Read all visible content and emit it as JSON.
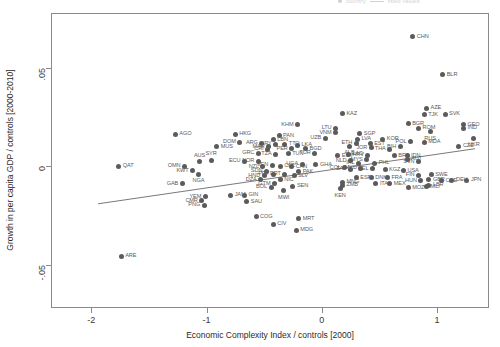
{
  "chart_data": {
    "type": "scatter",
    "title": "",
    "xlabel": "Economic Complexity Index / controls [2000]",
    "ylabel": "Growth in per capita GDP / controls [2000-2010]",
    "xlim": [
      -2.35,
      1.45
    ],
    "ylim": [
      -0.072,
      0.078
    ],
    "xticks": [
      -2,
      -1,
      0,
      1
    ],
    "xticklabels": [
      "-2",
      "-1",
      "0",
      "1"
    ],
    "yticks": [
      0.05,
      0,
      -0.05
    ],
    "yticklabels": [
      ".05",
      "0",
      "-.05"
    ],
    "grid": false,
    "legend_position": "top-right-clipped",
    "legend_entries": [
      "country",
      "fitted values"
    ],
    "point_color": "#5b5b5b",
    "line_color": "#6a6a6a",
    "fit_line": {
      "x0": -1.95,
      "y0": -0.0185,
      "x1": 1.32,
      "y1": 0.0095
    },
    "series_name": "country",
    "points": [
      {
        "code": "CHN",
        "x": 0.78,
        "y": 0.0665,
        "pos": "right"
      },
      {
        "code": "BLR",
        "x": 1.04,
        "y": 0.047,
        "pos": "right"
      },
      {
        "code": "AZE",
        "x": 0.9,
        "y": 0.03,
        "pos": "right"
      },
      {
        "code": "TJK",
        "x": 0.88,
        "y": 0.0268,
        "pos": "right"
      },
      {
        "code": "SVK",
        "x": 1.06,
        "y": 0.027,
        "pos": "right"
      },
      {
        "code": "KAZ",
        "x": 0.17,
        "y": 0.0272,
        "pos": "right"
      },
      {
        "code": "GEO",
        "x": 1.22,
        "y": 0.0218,
        "pos": "right"
      },
      {
        "code": "IND",
        "x": 1.22,
        "y": 0.0198,
        "pos": "right"
      },
      {
        "code": "BGR",
        "x": 0.74,
        "y": 0.0222,
        "pos": "right"
      },
      {
        "code": "ROM",
        "x": 0.83,
        "y": 0.02,
        "pos": "right"
      },
      {
        "code": "RUS",
        "x": 0.93,
        "y": 0.0182,
        "pos": "below"
      },
      {
        "code": "KHM",
        "x": -0.22,
        "y": 0.0218,
        "pos": "left"
      },
      {
        "code": "LTU",
        "x": 0.11,
        "y": 0.0198,
        "pos": "left"
      },
      {
        "code": "VNM",
        "x": 0.11,
        "y": 0.0176,
        "pos": "left"
      },
      {
        "code": "SGP",
        "x": 0.32,
        "y": 0.0172,
        "pos": "right"
      },
      {
        "code": "UKR",
        "x": 1.31,
        "y": 0.0148,
        "pos": "below"
      },
      {
        "code": "AGO",
        "x": -1.28,
        "y": 0.0168,
        "pos": "right"
      },
      {
        "code": "HKG",
        "x": -0.76,
        "y": 0.0168,
        "pos": "right"
      },
      {
        "code": "PAN",
        "x": -0.38,
        "y": 0.016,
        "pos": "right"
      },
      {
        "code": "UZB",
        "x": 0.02,
        "y": 0.0148,
        "pos": "left"
      },
      {
        "code": "LVA",
        "x": 0.3,
        "y": 0.0142,
        "pos": "right"
      },
      {
        "code": "KOR",
        "x": 0.52,
        "y": 0.0142,
        "pos": "right"
      },
      {
        "code": "POL",
        "x": 0.76,
        "y": 0.013,
        "pos": "left"
      },
      {
        "code": "MDA",
        "x": 0.88,
        "y": 0.0128,
        "pos": "right"
      },
      {
        "code": "CZE",
        "x": 1.18,
        "y": 0.0108,
        "pos": "right"
      },
      {
        "code": "LBN",
        "x": -0.43,
        "y": 0.014,
        "pos": "right"
      },
      {
        "code": "DOM",
        "x": -0.72,
        "y": 0.0128,
        "pos": "left"
      },
      {
        "code": "ARG",
        "x": -0.53,
        "y": 0.0124,
        "pos": "left"
      },
      {
        "code": "URY",
        "x": -0.41,
        "y": 0.0118,
        "pos": "left"
      },
      {
        "code": "TTO",
        "x": -0.33,
        "y": 0.0118,
        "pos": "right"
      },
      {
        "code": "ETH",
        "x": 0.29,
        "y": 0.0124,
        "pos": "left"
      },
      {
        "code": "EST",
        "x": 0.41,
        "y": 0.012,
        "pos": "right"
      },
      {
        "code": "ALB",
        "x": 0.23,
        "y": 0.0108,
        "pos": "below"
      },
      {
        "code": "JOR",
        "x": 0.42,
        "y": 0.01,
        "pos": "left"
      },
      {
        "code": "BIH",
        "x": 0.67,
        "y": 0.0104,
        "pos": "left"
      },
      {
        "code": "MAR",
        "x": -0.47,
        "y": 0.0104,
        "pos": "left"
      },
      {
        "code": "LKA",
        "x": -0.22,
        "y": 0.0112,
        "pos": "right"
      },
      {
        "code": "MUS",
        "x": -0.92,
        "y": 0.0104,
        "pos": "right"
      },
      {
        "code": "CRI",
        "x": -0.48,
        "y": 0.0092,
        "pos": "left"
      },
      {
        "code": "PER",
        "x": -0.27,
        "y": 0.0096,
        "pos": "left"
      },
      {
        "code": "BGD",
        "x": -0.15,
        "y": 0.0094,
        "pos": "right"
      },
      {
        "code": "THA",
        "x": 0.58,
        "y": 0.0092,
        "pos": "left"
      },
      {
        "code": "LAO",
        "x": 0.22,
        "y": 0.0068,
        "pos": "right"
      },
      {
        "code": "GRC",
        "x": -0.56,
        "y": 0.0072,
        "pos": "left"
      },
      {
        "code": "TZA",
        "x": -0.41,
        "y": 0.0068,
        "pos": "left"
      },
      {
        "code": "TUN",
        "x": -0.3,
        "y": 0.007,
        "pos": "right"
      },
      {
        "code": "TUR",
        "x": -0.07,
        "y": 0.0072,
        "pos": "left"
      },
      {
        "code": "EGY",
        "x": 0.13,
        "y": 0.006,
        "pos": "right"
      },
      {
        "code": "HRV",
        "x": 0.39,
        "y": 0.0062,
        "pos": "left"
      },
      {
        "code": "BRA",
        "x": 0.62,
        "y": 0.0058,
        "pos": "right"
      },
      {
        "code": "IDN",
        "x": 0.73,
        "y": 0.006,
        "pos": "right"
      },
      {
        "code": "AUT",
        "x": 0.73,
        "y": 0.0042,
        "pos": "right"
      },
      {
        "code": "SVN",
        "x": 0.83,
        "y": 0.003,
        "pos": "left"
      },
      {
        "code": "SYR",
        "x": -0.97,
        "y": 0.0036,
        "pos": "above"
      },
      {
        "code": "AUS",
        "x": -1.07,
        "y": 0.0028,
        "pos": "above"
      },
      {
        "code": "ECU",
        "x": -0.68,
        "y": 0.0032,
        "pos": "left"
      },
      {
        "code": "NOR",
        "x": -0.56,
        "y": 0.0032,
        "pos": "left"
      },
      {
        "code": "MYS",
        "x": 0.38,
        "y": 0.004,
        "pos": "left"
      },
      {
        "code": "NLD",
        "x": 0.24,
        "y": 0.0034,
        "pos": "left"
      },
      {
        "code": "IRL",
        "x": 0.31,
        "y": 0.0022,
        "pos": "left"
      },
      {
        "code": "PHL",
        "x": 0.45,
        "y": 0.0022,
        "pos": "right"
      },
      {
        "code": "QAT",
        "x": -1.77,
        "y": 0.0005,
        "pos": "right"
      },
      {
        "code": "OMN",
        "x": -1.2,
        "y": 0.0005,
        "pos": "left"
      },
      {
        "code": "KWT",
        "x": -1.13,
        "y": -0.0018,
        "pos": "left"
      },
      {
        "code": "NGA",
        "x": -1.08,
        "y": -0.0035,
        "pos": "below"
      },
      {
        "code": "NZL",
        "x": -0.52,
        "y": 0.0004,
        "pos": "left"
      },
      {
        "code": "CHL",
        "x": -0.37,
        "y": 0.0006,
        "pos": "right"
      },
      {
        "code": "VEN",
        "x": -0.44,
        "y": 0.0012,
        "pos": "left"
      },
      {
        "code": "USA",
        "x": 0.7,
        "y": -0.0018,
        "pos": "right"
      },
      {
        "code": "KGZ",
        "x": 0.54,
        "y": -0.0012,
        "pos": "right"
      },
      {
        "code": "BEL",
        "x": 0.43,
        "y": -0.0006,
        "pos": "left"
      },
      {
        "code": "MKD",
        "x": 0.33,
        "y": -0.0005,
        "pos": "left"
      },
      {
        "code": "ZAF",
        "x": 0.24,
        "y": -0.001,
        "pos": "left"
      },
      {
        "code": "COL",
        "x": 0.19,
        "y": -0.0002,
        "pos": "left"
      },
      {
        "code": "SDN",
        "x": -0.49,
        "y": -0.002,
        "pos": "left"
      },
      {
        "code": "CAN",
        "x": -0.27,
        "y": 0.0004,
        "pos": "right"
      },
      {
        "code": "UGA",
        "x": -0.18,
        "y": 0.0016,
        "pos": "left"
      },
      {
        "code": "GHA",
        "x": -0.06,
        "y": 0.0014,
        "pos": "right"
      },
      {
        "code": "PAK",
        "x": -0.21,
        "y": -0.0022,
        "pos": "right"
      },
      {
        "code": "SLV",
        "x": -0.25,
        "y": -0.0042,
        "pos": "right"
      },
      {
        "code": "PRT",
        "x": -0.33,
        "y": -0.0034,
        "pos": "left"
      },
      {
        "code": "PRY",
        "x": -0.43,
        "y": -0.0034,
        "pos": "left"
      },
      {
        "code": "HND",
        "x": -0.51,
        "y": -0.0042,
        "pos": "left"
      },
      {
        "code": "FIN",
        "x": 0.83,
        "y": -0.004,
        "pos": "left"
      },
      {
        "code": "SWE",
        "x": 0.94,
        "y": -0.0038,
        "pos": "right"
      },
      {
        "code": "GBR",
        "x": 0.92,
        "y": -0.0064,
        "pos": "right"
      },
      {
        "code": "HUN",
        "x": 0.85,
        "y": -0.0068,
        "pos": "left"
      },
      {
        "code": "CHE",
        "x": 1.03,
        "y": -0.0068,
        "pos": "right"
      },
      {
        "code": "DEU",
        "x": 1.12,
        "y": -0.0066,
        "pos": "right"
      },
      {
        "code": "JPN",
        "x": 1.25,
        "y": -0.0066,
        "pos": "right"
      },
      {
        "code": "ESP",
        "x": 0.29,
        "y": -0.0052,
        "pos": "right"
      },
      {
        "code": "DNK",
        "x": 0.42,
        "y": -0.0052,
        "pos": "right"
      },
      {
        "code": "FRA",
        "x": 0.56,
        "y": -0.0052,
        "pos": "right"
      },
      {
        "code": "LBR",
        "x": 0.92,
        "y": -0.009,
        "pos": "right"
      },
      {
        "code": "ITA",
        "x": 0.46,
        "y": -0.0082,
        "pos": "right"
      },
      {
        "code": "MEX",
        "x": 0.58,
        "y": -0.0082,
        "pos": "right"
      },
      {
        "code": "MOZ",
        "x": 0.74,
        "y": -0.0104,
        "pos": "right"
      },
      {
        "code": "MLI",
        "x": 0.9,
        "y": -0.0098,
        "pos": "right"
      },
      {
        "code": "MNG",
        "x": 0.17,
        "y": -0.0076,
        "pos": "right"
      },
      {
        "code": "ZMB",
        "x": 0.17,
        "y": -0.0092,
        "pos": "right"
      },
      {
        "code": "KEN",
        "x": 0.15,
        "y": -0.0108,
        "pos": "below"
      },
      {
        "code": "DZA",
        "x": -0.54,
        "y": -0.0062,
        "pos": "left"
      },
      {
        "code": "NIC",
        "x": -0.37,
        "y": -0.0062,
        "pos": "right"
      },
      {
        "code": "GTM",
        "x": -0.42,
        "y": -0.0084,
        "pos": "left"
      },
      {
        "code": "BOL",
        "x": -0.45,
        "y": -0.01,
        "pos": "left"
      },
      {
        "code": "SEN",
        "x": -0.26,
        "y": -0.0096,
        "pos": "right"
      },
      {
        "code": "MWI",
        "x": -0.34,
        "y": -0.0118,
        "pos": "below"
      },
      {
        "code": "GAB",
        "x": -1.22,
        "y": -0.0082,
        "pos": "left"
      },
      {
        "code": "YEM",
        "x": -1.02,
        "y": -0.015,
        "pos": "left"
      },
      {
        "code": "CMR",
        "x": -1.05,
        "y": -0.017,
        "pos": "left"
      },
      {
        "code": "PNG",
        "x": -1.03,
        "y": -0.0192,
        "pos": "left"
      },
      {
        "code": "JAM",
        "x": -0.8,
        "y": -0.0142,
        "pos": "right"
      },
      {
        "code": "GIN",
        "x": -0.68,
        "y": -0.0142,
        "pos": "right"
      },
      {
        "code": "SAU",
        "x": -0.66,
        "y": -0.0174,
        "pos": "right"
      },
      {
        "code": "COG",
        "x": -0.58,
        "y": -0.025,
        "pos": "right"
      },
      {
        "code": "CIV",
        "x": -0.43,
        "y": -0.029,
        "pos": "right"
      },
      {
        "code": "MRT",
        "x": -0.21,
        "y": -0.0262,
        "pos": "right"
      },
      {
        "code": "MDG",
        "x": -0.23,
        "y": -0.032,
        "pos": "right"
      },
      {
        "code": "ARE",
        "x": -1.75,
        "y": -0.0452,
        "pos": "right"
      }
    ]
  }
}
